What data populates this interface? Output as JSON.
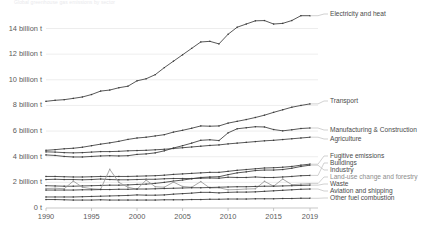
{
  "subtitle": "Global greenhouse gas emissions by sector",
  "axis": {
    "y_ticks": [
      "0 t",
      "2 billion t",
      "4 billion t",
      "6 billion t",
      "8 billion t",
      "10 billion t",
      "12 billion t",
      "14 billion t"
    ],
    "x_ticks": [
      "1990",
      "1995",
      "2000",
      "2005",
      "2010",
      "2015",
      "2019"
    ]
  },
  "chart_data": {
    "type": "line",
    "title": "Global greenhouse gas emissions by sector",
    "xlabel": "",
    "ylabel": "",
    "xlim": [
      1990,
      2019
    ],
    "ylim": [
      0,
      15.6
    ],
    "grid": true,
    "legend_position": "right-inline",
    "x": [
      1990,
      1991,
      1992,
      1993,
      1994,
      1995,
      1996,
      1997,
      1998,
      1999,
      2000,
      2001,
      2002,
      2003,
      2004,
      2005,
      2006,
      2007,
      2008,
      2009,
      2010,
      2011,
      2012,
      2013,
      2014,
      2015,
      2016,
      2017,
      2018,
      2019
    ],
    "y_unit": "billion tonnes CO2eq",
    "series": [
      {
        "name": "Electricity and heat",
        "color": "#3a3a3a",
        "values": [
          8.32,
          8.4,
          8.45,
          8.55,
          8.66,
          8.85,
          9.12,
          9.2,
          9.38,
          9.5,
          9.92,
          10.08,
          10.4,
          10.95,
          11.45,
          11.95,
          12.45,
          12.95,
          13.0,
          12.8,
          13.55,
          14.1,
          14.35,
          14.6,
          14.62,
          14.35,
          14.4,
          14.62,
          15.0,
          15.0
        ]
      },
      {
        "name": "Transport",
        "color": "#3a3a3a",
        "values": [
          4.5,
          4.55,
          4.62,
          4.66,
          4.74,
          4.86,
          4.98,
          5.08,
          5.2,
          5.35,
          5.46,
          5.52,
          5.62,
          5.72,
          5.92,
          6.06,
          6.22,
          6.4,
          6.38,
          6.4,
          6.62,
          6.76,
          6.9,
          7.06,
          7.24,
          7.46,
          7.66,
          7.86,
          8.0,
          8.12
        ]
      },
      {
        "name": "Manufacturing & Construction",
        "color": "#3a3a3a",
        "values": [
          4.14,
          4.1,
          4.02,
          3.98,
          3.98,
          4.02,
          4.06,
          4.08,
          4.06,
          4.08,
          4.18,
          4.22,
          4.3,
          4.46,
          4.68,
          4.86,
          5.06,
          5.28,
          5.32,
          5.26,
          5.86,
          6.18,
          6.26,
          6.34,
          6.32,
          6.12,
          6.02,
          6.1,
          6.2,
          6.24
        ]
      },
      {
        "name": "Agriculture",
        "color": "#3a3a3a",
        "values": [
          4.38,
          4.36,
          4.32,
          4.3,
          4.32,
          4.36,
          4.4,
          4.4,
          4.42,
          4.46,
          4.48,
          4.5,
          4.54,
          4.58,
          4.64,
          4.7,
          4.76,
          4.82,
          4.88,
          4.92,
          5.0,
          5.06,
          5.12,
          5.18,
          5.24,
          5.28,
          5.34,
          5.4,
          5.46,
          5.52
        ]
      },
      {
        "name": "Fugitive emissions",
        "color": "#3a3a3a",
        "values": [
          2.46,
          2.46,
          2.44,
          2.42,
          2.42,
          2.44,
          2.46,
          2.46,
          2.46,
          2.46,
          2.48,
          2.5,
          2.52,
          2.56,
          2.62,
          2.66,
          2.7,
          2.74,
          2.78,
          2.78,
          2.86,
          2.94,
          3.0,
          3.06,
          3.12,
          3.14,
          3.18,
          3.24,
          3.34,
          3.42
        ]
      },
      {
        "name": "Buildings",
        "color": "#3a3a3a",
        "values": [
          2.22,
          2.24,
          2.22,
          2.22,
          2.2,
          2.22,
          2.26,
          2.22,
          2.2,
          2.2,
          2.22,
          2.24,
          2.24,
          2.28,
          2.3,
          2.3,
          2.3,
          2.32,
          2.34,
          2.32,
          2.4,
          2.38,
          2.38,
          2.42,
          2.38,
          2.38,
          2.42,
          2.46,
          2.52,
          2.54
        ]
      },
      {
        "name": "Industry",
        "color": "#3a3a3a",
        "values": [
          1.74,
          1.72,
          1.7,
          1.7,
          1.72,
          1.74,
          1.76,
          1.78,
          1.78,
          1.8,
          1.84,
          1.86,
          1.92,
          2.0,
          2.1,
          2.18,
          2.28,
          2.38,
          2.42,
          2.44,
          2.6,
          2.74,
          2.82,
          2.92,
          2.96,
          2.96,
          3.0,
          3.1,
          3.24,
          3.34
        ]
      },
      {
        "name": "Land-use change and forestry",
        "color": "#9a9a9a",
        "values": [
          1.52,
          1.54,
          1.5,
          2.1,
          1.62,
          1.5,
          1.46,
          3.02,
          2.0,
          1.62,
          1.46,
          2.18,
          1.66,
          1.62,
          2.02,
          1.68,
          1.62,
          2.06,
          1.56,
          1.58,
          1.42,
          1.44,
          1.48,
          1.5,
          2.08,
          1.7,
          2.26,
          1.82,
          1.86,
          1.9
        ]
      },
      {
        "name": "Waste",
        "color": "#3a3a3a",
        "values": [
          1.4,
          1.4,
          1.4,
          1.4,
          1.42,
          1.42,
          1.44,
          1.44,
          1.46,
          1.46,
          1.48,
          1.48,
          1.5,
          1.52,
          1.54,
          1.56,
          1.58,
          1.58,
          1.6,
          1.62,
          1.64,
          1.66,
          1.66,
          1.68,
          1.7,
          1.7,
          1.72,
          1.74,
          1.76,
          1.78
        ]
      },
      {
        "name": "Aviation and shipping",
        "color": "#3a3a3a",
        "values": [
          0.86,
          0.86,
          0.86,
          0.86,
          0.88,
          0.9,
          0.92,
          0.94,
          0.96,
          0.98,
          1.02,
          1.0,
          1.0,
          1.02,
          1.08,
          1.12,
          1.16,
          1.22,
          1.22,
          1.18,
          1.22,
          1.24,
          1.24,
          1.26,
          1.3,
          1.34,
          1.38,
          1.42,
          1.46,
          1.48
        ]
      },
      {
        "name": "Other fuel combustion",
        "color": "#3a3a3a",
        "values": [
          0.66,
          0.66,
          0.64,
          0.62,
          0.62,
          0.62,
          0.64,
          0.62,
          0.62,
          0.62,
          0.62,
          0.62,
          0.62,
          0.64,
          0.64,
          0.64,
          0.66,
          0.66,
          0.68,
          0.68,
          0.7,
          0.7,
          0.7,
          0.72,
          0.72,
          0.72,
          0.74,
          0.74,
          0.76,
          0.76
        ]
      }
    ]
  },
  "legend": [
    {
      "label": "Electricity and heat",
      "muted": false
    },
    {
      "label": "Transport",
      "muted": false
    },
    {
      "label": "Manufacturing & Construction",
      "muted": false
    },
    {
      "label": "Agriculture",
      "muted": false
    },
    {
      "label": "Fugitive emissions",
      "muted": false
    },
    {
      "label": "Buildings",
      "muted": false
    },
    {
      "label": "Industry",
      "muted": false
    },
    {
      "label": "Land-use change and forestry",
      "muted": true
    },
    {
      "label": "Waste",
      "muted": false
    },
    {
      "label": "Aviation and shipping",
      "muted": false
    },
    {
      "label": "Other fuel combustion",
      "muted": false
    }
  ]
}
